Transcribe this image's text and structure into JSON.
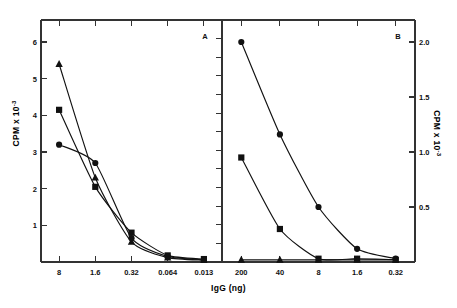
{
  "figure": {
    "xlabel": "IgG (ng)",
    "ylabel_left_text": "CPM x 10",
    "ylabel_left_exp": "-3",
    "ylabel_right_text": "CPM x 10",
    "ylabel_right_exp": "-3"
  },
  "chart_data": [
    {
      "type": "line",
      "panel": "A",
      "title": "A",
      "xlabel": "IgG (ng)",
      "ylabel": "CPM x 10^-3",
      "x_scale": "log-reverse",
      "categories": [
        "8",
        "1.6",
        "0.32",
        "0.064",
        "0.013"
      ],
      "x": [
        8,
        1.6,
        0.32,
        0.064,
        0.013
      ],
      "ylim": [
        0,
        6.6
      ],
      "yticks": [
        1,
        2,
        3,
        4,
        5,
        6
      ],
      "ytick_labels": [
        "1",
        "2",
        "3",
        "4",
        "5",
        "6"
      ],
      "grid": false,
      "legend": "none",
      "series": [
        {
          "name": "triangle",
          "marker": "triangle",
          "values": [
            5.4,
            2.3,
            0.55,
            0.12,
            0.05
          ]
        },
        {
          "name": "square",
          "marker": "square",
          "values": [
            4.15,
            2.05,
            0.8,
            0.18,
            0.08
          ]
        },
        {
          "name": "circle",
          "marker": "circle",
          "values": [
            3.2,
            2.7,
            0.65,
            0.15,
            0.06
          ]
        }
      ]
    },
    {
      "type": "line",
      "panel": "B",
      "title": "B",
      "xlabel": "IgG (ng)",
      "ylabel": "CPM x 10^-3",
      "x_scale": "log-reverse",
      "categories": [
        "200",
        "40",
        "8",
        "1.6",
        "0.32"
      ],
      "x": [
        200,
        40,
        8,
        1.6,
        0.32
      ],
      "ylim": [
        0,
        2.2
      ],
      "yticks": [
        0.5,
        1.0,
        1.5,
        2.0
      ],
      "ytick_labels": [
        "0.5",
        "1.0",
        "1.5",
        "2.0"
      ],
      "grid": false,
      "legend": "none",
      "series": [
        {
          "name": "circle",
          "marker": "circle",
          "values": [
            2.0,
            1.16,
            0.5,
            0.12,
            0.03
          ]
        },
        {
          "name": "square",
          "marker": "square",
          "values": [
            0.95,
            0.3,
            0.03,
            0.03,
            0.02
          ]
        },
        {
          "name": "triangle",
          "marker": "triangle",
          "values": [
            0.02,
            0.02,
            0.02,
            0.02,
            0.02
          ]
        }
      ]
    }
  ],
  "axes": {
    "panelA_yticks": [
      "6",
      "5",
      "4",
      "3",
      "2",
      "1"
    ],
    "panelA_xticks": [
      "8",
      "1.6",
      "0.32",
      "0.064",
      "0.013"
    ],
    "panelB_xticks": [
      "200",
      "40",
      "8",
      "1.6",
      "0.32"
    ],
    "panelB_yticks": [
      "2.0",
      "1.5",
      "1.0",
      "0.5"
    ]
  },
  "labels": {
    "panelA": "A",
    "panelB": "B"
  },
  "colors": {
    "ink": "#111111",
    "frame": "#333333"
  }
}
